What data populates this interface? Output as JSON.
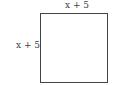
{
  "diagram": {
    "shape": "square",
    "top_side_label": "x + 5",
    "left_side_label": "x + 5",
    "stroke_color": "#444444"
  }
}
